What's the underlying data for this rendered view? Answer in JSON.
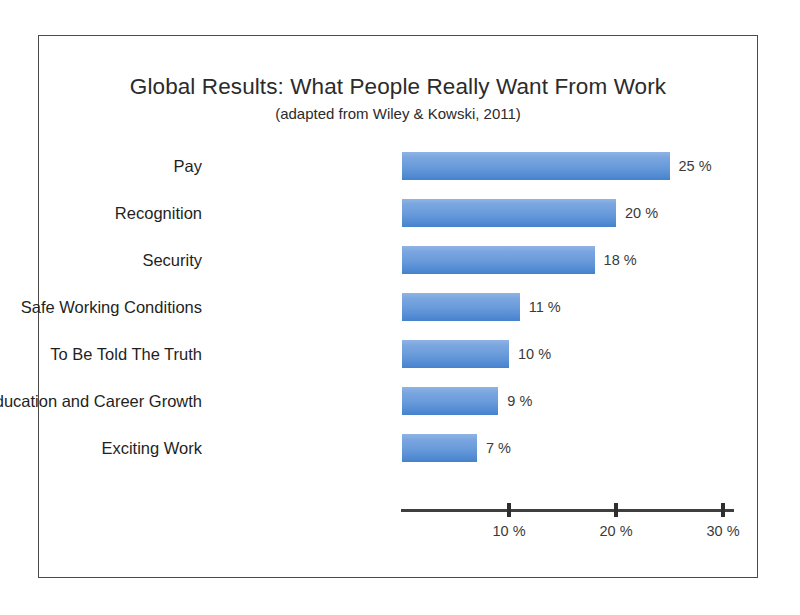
{
  "chart_data": {
    "type": "bar",
    "orientation": "horizontal",
    "title": "Global Results: What People Really Want From Work",
    "subtitle": "(adapted from Wiley & Kowski, 2011)",
    "xlabel": "",
    "ylabel": "",
    "grid": false,
    "legend": null,
    "xlim": [
      0,
      32
    ],
    "categories": [
      "Pay",
      "Recognition",
      "Security",
      "Safe Working Conditions",
      "To Be Told The Truth",
      "Education and Career Growth",
      "Exciting Work"
    ],
    "values": [
      25,
      20,
      18,
      11,
      10,
      9,
      7
    ],
    "value_labels": [
      "25 %",
      "20 %",
      "18 %",
      "11 %",
      "10 %",
      "9 %",
      "7 %"
    ],
    "axis_ticks": [
      10,
      20,
      30
    ],
    "axis_tick_labels": [
      "10 %",
      "20 %",
      "30 %"
    ],
    "bar_color": "#6899da",
    "bar_color_top": "#8fb4e4",
    "bar_color_bottom": "#4681cd",
    "text_color": "#2b2b2b",
    "axis_color": "#3f3f3f"
  }
}
